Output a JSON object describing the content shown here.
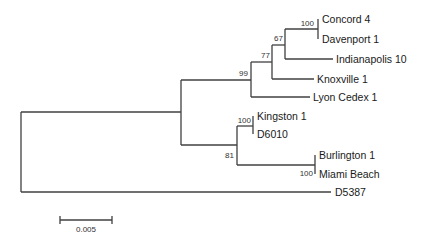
{
  "tree": {
    "type": "phylogenetic-tree",
    "leaves": [
      {
        "id": "concord",
        "label": "Concord 4"
      },
      {
        "id": "davenport",
        "label": "Davenport 1"
      },
      {
        "id": "indianapolis",
        "label": "Indianapolis 10"
      },
      {
        "id": "knoxville",
        "label": "Knoxville 1"
      },
      {
        "id": "lyon",
        "label": "Lyon Cedex 1"
      },
      {
        "id": "kingston",
        "label": "Kingston 1"
      },
      {
        "id": "d6010",
        "label": "D6010"
      },
      {
        "id": "burlington",
        "label": "Burlington 1"
      },
      {
        "id": "miami",
        "label": "Miami Beach"
      },
      {
        "id": "d5387",
        "label": "D5387"
      }
    ],
    "bootstrap": {
      "concord_davenport": "100",
      "clade_67": "67",
      "clade_77": "77",
      "clade_99": "99",
      "kingston_d6010": "100",
      "clade_81": "81",
      "burlington_miami": "100"
    },
    "scale_bar": {
      "label": "0.005"
    }
  }
}
